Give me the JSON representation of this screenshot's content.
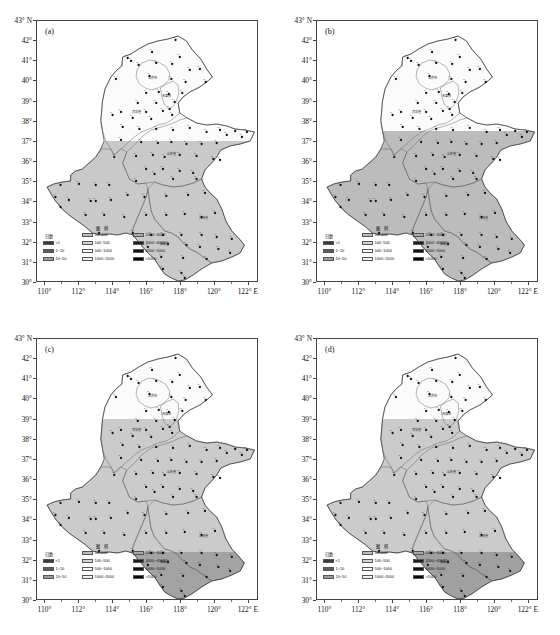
{
  "figure": {
    "type": "map-grid",
    "panels_across": 2,
    "panels_down": 2,
    "region": "North China Plain / Huang-Huai-Hai region",
    "background": "#ffffff"
  },
  "axes": {
    "y_unit": "43° N",
    "y_labels": [
      "43° N",
      "42°",
      "41°",
      "40°",
      "39°",
      "38°",
      "37°",
      "36°",
      "35°",
      "34°",
      "33°",
      "32°",
      "31°",
      "30°"
    ],
    "y_values": [
      43,
      42,
      41,
      40,
      39,
      38,
      37,
      36,
      35,
      34,
      33,
      32,
      31,
      30
    ],
    "y_min": 30,
    "y_max": 43,
    "x_labels": [
      "110°",
      "112°",
      "114°",
      "116°",
      "118°",
      "120°",
      "122° E"
    ],
    "x_values": [
      110,
      112,
      114,
      116,
      118,
      120,
      122
    ],
    "x_min": 109.5,
    "x_max": 122.6,
    "x_minor_step": 1,
    "y_minor_step": 1
  },
  "legend": {
    "left_title": "日数",
    "title": "图 例",
    "left_items": [
      {
        "label": "<1",
        "color": "#3a3a3a"
      },
      {
        "label": "1~10",
        "color": "#5a5a5a"
      },
      {
        "label": "10~50",
        "color": "#9d9d9d"
      }
    ],
    "col1": [
      {
        "label": "50~100",
        "color": "#bdbdbd"
      },
      {
        "label": "100~500",
        "color": "#d6d6d6"
      },
      {
        "label": "500~1000",
        "color": "#ffffff"
      },
      {
        "label": "1000~2000",
        "color": "#f2f2f2"
      }
    ],
    "col2": [
      {
        "label": "2000~3000",
        "color": "#a8a8a8"
      },
      {
        "label": "3000~4000",
        "color": "#1c1c1c"
      },
      {
        "label": "4000~5000",
        "color": "#111111"
      },
      {
        "label": ">5000",
        "color": "#000000"
      }
    ]
  },
  "panels": [
    {
      "tag": "(a)",
      "shading": [
        {
          "name": "south-light-gray",
          "color": "#c9c9c9",
          "extent": "south of ~37°N"
        },
        {
          "name": "north-white",
          "color": "#fbfbfb",
          "extent": "north of ~37°N"
        }
      ]
    },
    {
      "tag": "(b)",
      "shading": [
        {
          "name": "south-gray",
          "color": "#bdbdbd",
          "extent": "south of ~37.5°N"
        },
        {
          "name": "north-white",
          "color": "#fbfbfb",
          "extent": "north of ~37.5°N"
        }
      ]
    },
    {
      "tag": "(c)",
      "shading": [
        {
          "name": "mid-light-gray",
          "color": "#cbcbcb",
          "extent": "south of ~39°N"
        },
        {
          "name": "south-dark-gray",
          "color": "#a3a3a3",
          "extent": "far south, below ~32.3°N"
        },
        {
          "name": "north-white",
          "color": "#fbfbfb",
          "extent": "north of ~39°N"
        }
      ]
    },
    {
      "tag": "(d)",
      "shading": [
        {
          "name": "mid-light-gray",
          "color": "#cbcbcb",
          "extent": "south of ~39°N"
        },
        {
          "name": "south-dark-gray",
          "color": "#a0a0a0",
          "extent": "far south, below ~32.3°N"
        },
        {
          "name": "north-white",
          "color": "#fbfbfb",
          "extent": "north of ~39°N"
        }
      ]
    }
  ],
  "provinces": [
    {
      "name": "北京市",
      "lon": 116.35,
      "lat": 40.1
    },
    {
      "name": "天津市",
      "lon": 117.2,
      "lat": 39.2
    },
    {
      "name": "河北省",
      "lon": 115.4,
      "lat": 38.4
    },
    {
      "name": "山东省",
      "lon": 117.5,
      "lat": 36.3
    },
    {
      "name": "江苏省",
      "lon": 119.4,
      "lat": 33.1
    },
    {
      "name": "安徽省",
      "lon": 117.1,
      "lat": 31.8
    }
  ],
  "stations": [
    {
      "lon": 117.75,
      "lat": 42.05
    },
    {
      "lon": 114.9,
      "lat": 41.15
    },
    {
      "lon": 115.1,
      "lat": 41.0
    },
    {
      "lon": 116.35,
      "lat": 41.45
    },
    {
      "lon": 118.0,
      "lat": 41.2
    },
    {
      "lon": 115.55,
      "lat": 40.8
    },
    {
      "lon": 116.6,
      "lat": 40.9
    },
    {
      "lon": 117.55,
      "lat": 40.85
    },
    {
      "lon": 119.2,
      "lat": 40.6
    },
    {
      "lon": 118.6,
      "lat": 40.55
    },
    {
      "lon": 114.2,
      "lat": 40.1
    },
    {
      "lon": 116.2,
      "lat": 40.25
    },
    {
      "lon": 117.5,
      "lat": 40.1
    },
    {
      "lon": 118.35,
      "lat": 39.95
    },
    {
      "lon": 119.55,
      "lat": 39.95
    },
    {
      "lon": 116.0,
      "lat": 39.4
    },
    {
      "lon": 116.75,
      "lat": 39.45
    },
    {
      "lon": 117.35,
      "lat": 39.35
    },
    {
      "lon": 118.15,
      "lat": 39.4
    },
    {
      "lon": 115.5,
      "lat": 38.9
    },
    {
      "lon": 116.6,
      "lat": 38.9
    },
    {
      "lon": 117.7,
      "lat": 38.95
    },
    {
      "lon": 114.5,
      "lat": 38.45
    },
    {
      "lon": 116.0,
      "lat": 38.45
    },
    {
      "lon": 117.0,
      "lat": 38.5
    },
    {
      "lon": 117.4,
      "lat": 38.6
    },
    {
      "lon": 114.0,
      "lat": 38.3
    },
    {
      "lon": 115.2,
      "lat": 38.15
    },
    {
      "lon": 116.3,
      "lat": 38.1
    },
    {
      "lon": 117.55,
      "lat": 38.3
    },
    {
      "lon": 114.6,
      "lat": 37.7
    },
    {
      "lon": 115.6,
      "lat": 37.6
    },
    {
      "lon": 116.6,
      "lat": 37.6
    },
    {
      "lon": 117.6,
      "lat": 37.55
    },
    {
      "lon": 118.6,
      "lat": 37.65
    },
    {
      "lon": 119.6,
      "lat": 37.45
    },
    {
      "lon": 120.4,
      "lat": 37.55
    },
    {
      "lon": 121.3,
      "lat": 37.5
    },
    {
      "lon": 122.0,
      "lat": 37.45
    },
    {
      "lon": 120.8,
      "lat": 37.3
    },
    {
      "lon": 121.7,
      "lat": 37.2
    },
    {
      "lon": 114.5,
      "lat": 37.05
    },
    {
      "lon": 115.7,
      "lat": 36.95
    },
    {
      "lon": 116.7,
      "lat": 36.9
    },
    {
      "lon": 117.5,
      "lat": 36.95
    },
    {
      "lon": 118.4,
      "lat": 36.85
    },
    {
      "lon": 119.3,
      "lat": 36.85
    },
    {
      "lon": 120.2,
      "lat": 36.9
    },
    {
      "lon": 114.1,
      "lat": 36.2
    },
    {
      "lon": 115.4,
      "lat": 36.25
    },
    {
      "lon": 116.4,
      "lat": 36.3
    },
    {
      "lon": 117.1,
      "lat": 36.2
    },
    {
      "lon": 118.0,
      "lat": 36.3
    },
    {
      "lon": 119.0,
      "lat": 36.25
    },
    {
      "lon": 120.0,
      "lat": 36.1
    },
    {
      "lon": 120.4,
      "lat": 36.05
    },
    {
      "lon": 116.0,
      "lat": 35.6
    },
    {
      "lon": 117.0,
      "lat": 35.6
    },
    {
      "lon": 118.0,
      "lat": 35.5
    },
    {
      "lon": 118.8,
      "lat": 35.4
    },
    {
      "lon": 110.9,
      "lat": 34.8
    },
    {
      "lon": 112.0,
      "lat": 34.85
    },
    {
      "lon": 113.0,
      "lat": 34.8
    },
    {
      "lon": 113.8,
      "lat": 34.8
    },
    {
      "lon": 115.4,
      "lat": 35.0
    },
    {
      "lon": 116.5,
      "lat": 35.35
    },
    {
      "lon": 117.6,
      "lat": 35.1
    },
    {
      "lon": 119.0,
      "lat": 35.1
    },
    {
      "lon": 110.6,
      "lat": 34.2
    },
    {
      "lon": 111.4,
      "lat": 34.05
    },
    {
      "lon": 112.7,
      "lat": 34.0
    },
    {
      "lon": 113.0,
      "lat": 34.0
    },
    {
      "lon": 113.9,
      "lat": 34.05
    },
    {
      "lon": 114.9,
      "lat": 34.3
    },
    {
      "lon": 115.9,
      "lat": 34.2
    },
    {
      "lon": 117.2,
      "lat": 34.25
    },
    {
      "lon": 118.5,
      "lat": 34.3
    },
    {
      "lon": 119.5,
      "lat": 34.4
    },
    {
      "lon": 110.9,
      "lat": 33.7
    },
    {
      "lon": 112.4,
      "lat": 33.3
    },
    {
      "lon": 113.5,
      "lat": 33.3
    },
    {
      "lon": 114.7,
      "lat": 33.2
    },
    {
      "lon": 116.0,
      "lat": 33.3
    },
    {
      "lon": 117.2,
      "lat": 33.3
    },
    {
      "lon": 118.3,
      "lat": 33.35
    },
    {
      "lon": 119.3,
      "lat": 33.2
    },
    {
      "lon": 120.1,
      "lat": 33.4
    },
    {
      "lon": 113.2,
      "lat": 32.4
    },
    {
      "lon": 115.2,
      "lat": 32.4
    },
    {
      "lon": 116.3,
      "lat": 32.3
    },
    {
      "lon": 117.0,
      "lat": 32.3
    },
    {
      "lon": 118.1,
      "lat": 32.3
    },
    {
      "lon": 119.3,
      "lat": 32.3
    },
    {
      "lon": 120.2,
      "lat": 32.2
    },
    {
      "lon": 121.1,
      "lat": 32.1
    },
    {
      "lon": 116.1,
      "lat": 31.7
    },
    {
      "lon": 117.3,
      "lat": 31.85
    },
    {
      "lon": 118.4,
      "lat": 31.8
    },
    {
      "lon": 119.2,
      "lat": 31.7
    },
    {
      "lon": 120.3,
      "lat": 31.6
    },
    {
      "lon": 121.0,
      "lat": 31.4
    },
    {
      "lon": 116.9,
      "lat": 31.2
    },
    {
      "lon": 118.2,
      "lat": 31.15
    },
    {
      "lon": 119.6,
      "lat": 31.1
    },
    {
      "lon": 117.0,
      "lat": 30.6
    },
    {
      "lon": 118.1,
      "lat": 30.4
    },
    {
      "lon": 118.3,
      "lat": 30.15
    }
  ]
}
